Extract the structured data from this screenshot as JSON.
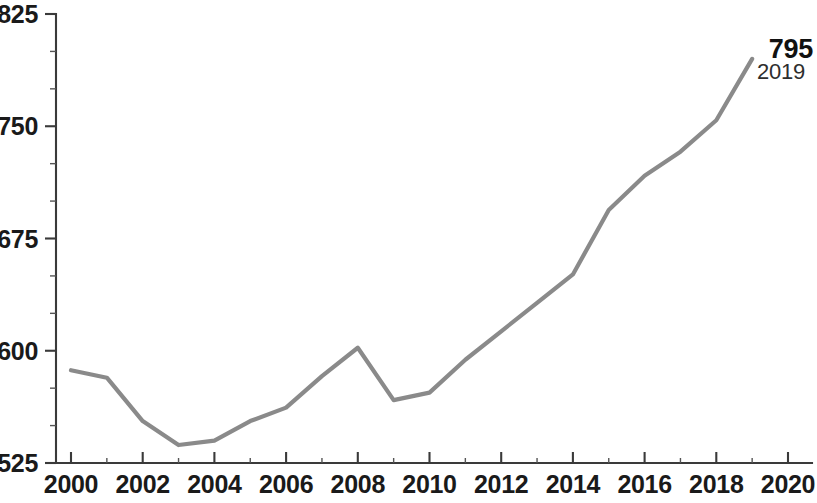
{
  "chart_data": {
    "type": "line",
    "title": "",
    "subtitle": "",
    "xlabel": "",
    "ylabel": "",
    "x": [
      2000,
      2001,
      2002,
      2003,
      2004,
      2005,
      2006,
      2007,
      2008,
      2009,
      2010,
      2011,
      2012,
      2013,
      2014,
      2015,
      2016,
      2017,
      2018,
      2019
    ],
    "values": [
      587,
      582,
      553,
      537,
      540,
      553,
      562,
      583,
      602,
      567,
      572,
      594,
      613,
      632,
      651,
      694,
      717,
      733,
      754,
      795
    ],
    "series": [
      {
        "name": "",
        "values": [
          587,
          582,
          553,
          537,
          540,
          553,
          562,
          583,
          602,
          567,
          572,
          594,
          613,
          632,
          651,
          694,
          717,
          733,
          754,
          795
        ],
        "color": "#8a8a8a"
      }
    ],
    "xlim": [
      2000,
      2020
    ],
    "ylim": [
      525,
      825
    ],
    "y_ticks": [
      525,
      600,
      675,
      750,
      825
    ],
    "y_tick_labels": [
      "525",
      "600",
      "675",
      "750",
      "825"
    ],
    "y_minor_step": 25,
    "x_ticks": [
      2000,
      2002,
      2004,
      2006,
      2008,
      2010,
      2012,
      2014,
      2016,
      2018,
      2020
    ],
    "x_tick_labels": [
      "2000",
      "2002",
      "2004",
      "2006",
      "2008",
      "2010",
      "2012",
      "2014",
      "2016",
      "2018",
      "2020"
    ],
    "x_minor_step": 1,
    "grid": false,
    "legend": null,
    "annotations": [
      {
        "name": "endpoint-label",
        "value_label": "795",
        "year_label": "2019",
        "x": 2019,
        "y": 795
      }
    ]
  },
  "annotation": {
    "value_label": "795",
    "year_label": "2019"
  },
  "axes": {
    "y_labels": [
      "825",
      "750",
      "675",
      "600",
      "525"
    ],
    "x_labels": [
      "2000",
      "2002",
      "2004",
      "2006",
      "2008",
      "2010",
      "2012",
      "2014",
      "2016",
      "2018",
      "2020"
    ]
  }
}
